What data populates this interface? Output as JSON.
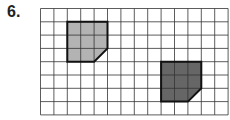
{
  "problem": {
    "number": "6."
  },
  "grid": {
    "cols": 14,
    "rows": 8,
    "origin_x": 40.5,
    "origin_y": 8.5,
    "cell_w": 13.4,
    "cell_h": 13.3,
    "line_color": "#333333"
  },
  "shapes": [
    {
      "name": "light-shape",
      "fill": "#b3b3b3",
      "col": 2,
      "row": 1,
      "w": 3,
      "h": 3,
      "cut": "bottom-right"
    },
    {
      "name": "dark-shape",
      "fill": "#666666",
      "col": 9,
      "row": 4,
      "w": 3,
      "h": 3,
      "cut": "bottom-right"
    }
  ]
}
